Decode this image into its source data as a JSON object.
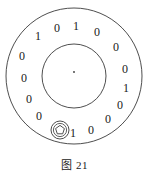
{
  "figure": {
    "caption": "图 21",
    "title": "图 21",
    "type": "encoder-code-disc",
    "stroke_color": "#3a3a3a",
    "text_color": "#202020",
    "background_color": "#ffffff"
  },
  "disc": {
    "center_x": 74,
    "center_y": 76,
    "outer_radius": 68,
    "inner_radius": 32,
    "center_dot_label": "·",
    "index_marker": {
      "name": "pentagon-index-marker",
      "center_x": 60,
      "center_y": 130,
      "outer_radius": 9,
      "inner_radius": 5.5
    }
  },
  "code_ring": {
    "label": "binary code ring",
    "digit_count": 16,
    "digits": [
      {
        "value": "0",
        "x": 22,
        "y": 57
      },
      {
        "value": "1",
        "x": 38,
        "y": 37
      },
      {
        "value": "0",
        "x": 57,
        "y": 29
      },
      {
        "value": "1",
        "x": 76,
        "y": 27
      },
      {
        "value": "0",
        "x": 97,
        "y": 33
      },
      {
        "value": "0",
        "x": 116,
        "y": 48
      },
      {
        "value": "0",
        "x": 125,
        "y": 70
      },
      {
        "value": "1",
        "x": 126,
        "y": 89
      },
      {
        "value": "0",
        "x": 120,
        "y": 106
      },
      {
        "value": "0",
        "x": 108,
        "y": 120
      },
      {
        "value": "0",
        "x": 91,
        "y": 131
      },
      {
        "value": "1",
        "x": 73,
        "y": 134
      },
      {
        "value": "0",
        "x": 39,
        "y": 117
      },
      {
        "value": "0",
        "x": 29,
        "y": 100
      },
      {
        "value": "0",
        "x": 24,
        "y": 79
      },
      {
        "value": "0",
        "x": 22,
        "y": 57
      }
    ],
    "sequence": "0 1 0 1 0 0 0 1 0 0 0 1 0 0 0"
  }
}
